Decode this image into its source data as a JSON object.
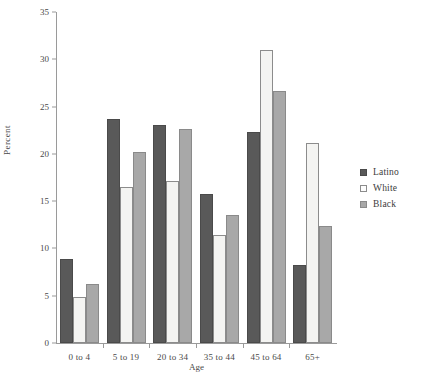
{
  "chart_data": {
    "type": "bar",
    "title": "",
    "subtitle": "",
    "xlabel": "Age",
    "ylabel": "Percent",
    "categories": [
      "0 to 4",
      "5 to 19",
      "20 to 34",
      "35 to 44",
      "45 to 64",
      "65+"
    ],
    "series": [
      {
        "name": "Latino",
        "color": "#595959",
        "values": [
          8.9,
          23.7,
          23.1,
          15.8,
          22.3,
          8.2
        ]
      },
      {
        "name": "White",
        "color": "#f4f4f2",
        "values": [
          4.9,
          16.5,
          17.1,
          11.4,
          31.0,
          21.2
        ]
      },
      {
        "name": "Black",
        "color": "#a8a8a8",
        "values": [
          6.2,
          20.2,
          22.6,
          13.5,
          26.7,
          12.4
        ]
      }
    ],
    "ylim": [
      0,
      35
    ],
    "yticks": [
      0,
      5,
      10,
      15,
      20,
      25,
      30,
      35
    ],
    "grid": false,
    "legend_position": "right"
  },
  "legend": {
    "items": [
      {
        "label": "Latino"
      },
      {
        "label": "White"
      },
      {
        "label": "Black"
      }
    ]
  },
  "axes": {
    "y_label": "Percent",
    "x_label": "Age",
    "y_tick_labels": [
      "0",
      "5",
      "10",
      "15",
      "20",
      "25",
      "30",
      "35"
    ],
    "x_tick_labels": [
      "0 to 4",
      "5 to 19",
      "20 to 34",
      "35 to 44",
      "45 to 64",
      "65+"
    ]
  }
}
